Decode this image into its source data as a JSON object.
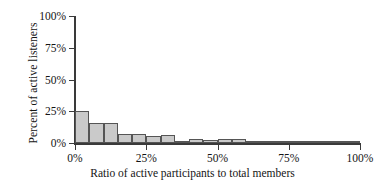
{
  "chart_data": {
    "type": "bar",
    "title": "",
    "subtitle": "",
    "xlabel": "Ratio of active participants to total members",
    "ylabel": "Percent of active listeners",
    "xlim": [
      0,
      100
    ],
    "ylim": [
      0,
      100
    ],
    "grid": false,
    "legend": null,
    "bin_width": 5,
    "x_unit": "%",
    "y_unit": "%",
    "xticks": [
      {
        "value": 0,
        "label": "0%"
      },
      {
        "value": 25,
        "label": "25%"
      },
      {
        "value": 50,
        "label": "50%"
      },
      {
        "value": 75,
        "label": "75%"
      },
      {
        "value": 100,
        "label": "100%"
      }
    ],
    "yticks": [
      {
        "value": 0,
        "label": "0%"
      },
      {
        "value": 25,
        "label": "25%"
      },
      {
        "value": 50,
        "label": "50%"
      },
      {
        "value": 75,
        "label": "75%"
      },
      {
        "value": 100,
        "label": "100%"
      }
    ],
    "categories": [
      "0-5%",
      "5-10%",
      "10-15%",
      "15-20%",
      "20-25%",
      "25-30%",
      "30-35%",
      "35-40%",
      "40-45%",
      "45-50%",
      "50-55%",
      "55-60%",
      "60-65%",
      "65-70%",
      "70-75%",
      "75-80%",
      "80-85%",
      "85-90%",
      "90-95%",
      "95-100%"
    ],
    "bin_starts": [
      0,
      5,
      10,
      15,
      20,
      25,
      30,
      35,
      40,
      45,
      50,
      55,
      60,
      65,
      70,
      75,
      80,
      85,
      90,
      95
    ],
    "values": [
      25,
      16,
      16,
      7,
      7,
      5.5,
      6,
      1.5,
      3,
      2.5,
      3,
      3,
      0.4,
      0.4,
      1.5,
      1.2,
      0.3,
      0.3,
      0.3,
      0.6
    ],
    "series": [
      {
        "name": "Percent of active listeners",
        "values": [
          25,
          16,
          16,
          7,
          7,
          5.5,
          6,
          1.5,
          3,
          2.5,
          3,
          3,
          0.4,
          0.4,
          1.5,
          1.2,
          0.3,
          0.3,
          0.3,
          0.6
        ]
      }
    ],
    "colors": {
      "bar_fill": "#cacaca",
      "bar_edge": "#555555",
      "axis": "#3a3a3a",
      "text": "#141414",
      "background": "#ffffff"
    }
  }
}
